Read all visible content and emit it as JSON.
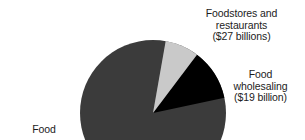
{
  "chart_data": {
    "type": "pie",
    "title": "",
    "subtitle": "",
    "xlabel": "",
    "ylabel": "",
    "legend_position": "callout-labels",
    "grid": false,
    "units": "billions of dollars",
    "categories": [
      "Foodstores and restaurants",
      "Food wholesaling",
      "Food"
    ],
    "values": [
      27,
      19,
      132
    ],
    "slices": [
      {
        "name": "Foodstores and restaurants",
        "value": 27,
        "value_text": "($27 billions)",
        "color": "#000000",
        "start_angle_deg": 12,
        "end_angle_deg": 53,
        "label_lines": [
          "Foodstores and",
          "restaurants",
          "($27 billions)"
        ]
      },
      {
        "name": "Food wholesaling",
        "value": 19,
        "value_text": "($19 billion)",
        "color": "#c9c9c9",
        "start_angle_deg": 53,
        "end_angle_deg": 80,
        "label_lines": [
          "Food",
          "wholesaling",
          "($19 billion)"
        ]
      },
      {
        "name": "Food",
        "value": 132,
        "value_text": "",
        "color": "#3b3b3b",
        "start_angle_deg": 80,
        "end_angle_deg": 372,
        "label_lines": [
          "Food"
        ]
      }
    ]
  },
  "figure": {
    "labels": {
      "foodstores": {
        "line1": "Foodstores and",
        "line2": "restaurants",
        "line3": "($27 billions)"
      },
      "wholesaling": {
        "line1": "Food",
        "line2": "wholesaling",
        "line3": "($19 billion)"
      },
      "food_manufacturing": {
        "line1": "Food"
      }
    },
    "colors": {
      "slice_black": "#000000",
      "slice_light_gray": "#c9c9c9",
      "slice_dark_gray": "#3b3b3b",
      "background": "#ffffff",
      "text": "#1c1c1c"
    }
  }
}
